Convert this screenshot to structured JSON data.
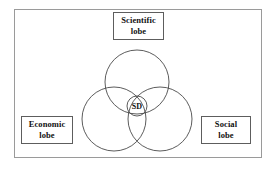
{
  "diagram": {
    "frame": {
      "border_color": "#9a9a9a",
      "background": "#ffffff"
    },
    "stroke_color": "#4a4a4a",
    "labels": {
      "scientific": "Scientific\nlobe",
      "economic": "Economic\nlobe",
      "social": "Social\nlobe",
      "center": "SD"
    },
    "circles": [
      {
        "name": "scientific-lobe-circle",
        "cx": 137,
        "cy": 82,
        "r": 32
      },
      {
        "name": "economic-lobe-circle",
        "cx": 114,
        "cy": 119,
        "r": 32
      },
      {
        "name": "social-lobe-circle",
        "cx": 160,
        "cy": 119,
        "r": 32
      },
      {
        "name": "sd-center-circle",
        "cx": 137,
        "cy": 106,
        "r": 10
      }
    ]
  }
}
